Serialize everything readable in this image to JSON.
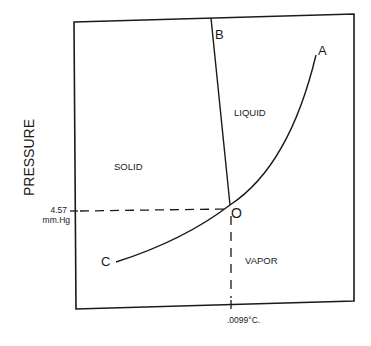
{
  "diagram": {
    "axis": {
      "y_label": "PRESSURE",
      "pressure_tick": [
        "4.57",
        "mm.Hg"
      ],
      "temperature_tick": ".0099°C."
    },
    "regions": {
      "solid": "SOLID",
      "liquid": "LIQUID",
      "vapor": "VAPOR"
    },
    "points": {
      "a": "A",
      "b": "B",
      "c": "C",
      "triple": "O"
    },
    "colors": {
      "line": "#1a1a1a",
      "background": "#ffffff"
    }
  }
}
